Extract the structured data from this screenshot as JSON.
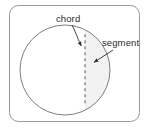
{
  "figure": {
    "frame": {
      "name": "diagram-frame",
      "x": 9,
      "y": 5,
      "width": 131,
      "height": 117,
      "corner_radius": 9,
      "stroke_color": "#9a9a9a",
      "fill_color": "#ffffff"
    },
    "circle": {
      "name": "circle-outline",
      "center_x": 65,
      "center_y": 70,
      "radius": 45,
      "stroke_color": "#6e6e6e",
      "fill_color": "#ffffff"
    },
    "chord_line": {
      "name": "chord-dashed-line",
      "x": 85,
      "y_top": 34.3,
      "y_bottom": 105.7,
      "stroke_color": "#555555",
      "dash_pattern": "3 3"
    },
    "segment_region": {
      "name": "segment-shaded-region",
      "fill_color": "#f2f2f2",
      "description": "area between chord and minor arc"
    },
    "labels": [
      {
        "name": "chord-label",
        "text": "chord",
        "x": 56,
        "y": 22,
        "color": "#2b2b2b"
      },
      {
        "name": "segment-label",
        "text": "segment",
        "x": 102,
        "y": 46,
        "color": "#2b2b2b"
      }
    ],
    "leaders": [
      {
        "name": "chord-leader-arrow",
        "path": "M 72 24 C 76 33, 78 40, 81.5 46",
        "arrow_tip_x": 83,
        "arrow_tip_y": 48,
        "stroke_color": "#2b2b2b"
      },
      {
        "name": "segment-leader-arrow",
        "path": "M 113 50 L 94 62",
        "arrow_tip_x": 91.5,
        "arrow_tip_y": 63.5,
        "stroke_color": "#2b2b2b"
      }
    ],
    "colors": {
      "frame_stroke": "#9a9a9a",
      "circle_stroke": "#6e6e6e",
      "chord_stroke": "#555555",
      "segment_fill": "#f2f2f2",
      "text": "#2b2b2b",
      "background": "#ffffff"
    }
  }
}
